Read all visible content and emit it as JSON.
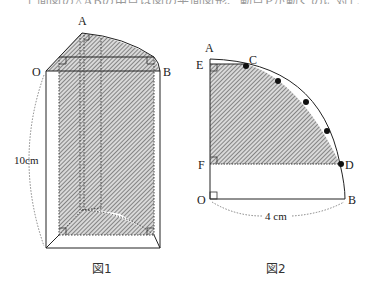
{
  "top_text": {
    "content": "上面図の△ABの中点は図の平面図形、動点Pが動くのに対して以下のとする。"
  },
  "figure1": {
    "caption": "図1",
    "labels": {
      "A": "A",
      "O": "O",
      "B": "B"
    },
    "dimension_label": "10cm"
  },
  "figure2": {
    "caption": "図2",
    "labels": {
      "A": "A",
      "E": "E",
      "C": "C",
      "F": "F",
      "D": "D",
      "O": "O",
      "B": "B"
    },
    "dimension_label": "4 cm",
    "arc_points_marked": 5
  },
  "colors": {
    "line": "#222222",
    "hatch": "#555555",
    "hatch_bg": "#d6d6d6",
    "dotted": "#666666"
  }
}
